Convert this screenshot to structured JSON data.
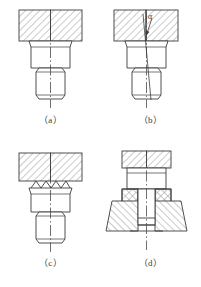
{
  "figure": {
    "panel_count": 4,
    "stroke_color": "#3c3c3c",
    "hatch_color": "#7a7a7a",
    "centerline_color": "#4a4a4a",
    "background": "#ffffff"
  },
  "panels": [
    {
      "id": "a",
      "caption": "（a）",
      "description": "Flat die face, straight vertical billet axis, billet upset correctly",
      "elements": {
        "die_block": "hatched-rectangle",
        "head": "trapezoid-upset-head",
        "body": "chamfered-cylinder",
        "axis": "vertical-centerline"
      }
    },
    {
      "id": "b",
      "caption": "（b）",
      "description": "Billet axis tilted from vertical by angle alpha, buckling indicated by leader arrow",
      "angle_label": "α",
      "elements": {
        "die_block": "hatched-rectangle",
        "head": "trapezoid-upset-head",
        "body": "chamfered-cylinder",
        "axis": "tilted-centerline",
        "leader": "arrow-to-die-face"
      }
    },
    {
      "id": "c",
      "caption": "（c）",
      "description": "Serrated / toothed die face gripping the billet end",
      "teeth_count": 4,
      "elements": {
        "die_block": "hatched-rectangle",
        "teeth": "zigzag-serration",
        "head": "trapezoid-upset-head",
        "body": "chamfered-cylinder",
        "axis": "vertical-centerline"
      }
    },
    {
      "id": "d",
      "caption": "（d）",
      "description": "Billet constrained inside a tapered die cavity with punch above",
      "elements": {
        "punch": "hatched-rectangle",
        "punch_shank": "cylinder",
        "die_body": "tapered-hatched-die",
        "cavity_part": "billet-in-cavity",
        "axis": "vertical-centerline"
      }
    }
  ]
}
